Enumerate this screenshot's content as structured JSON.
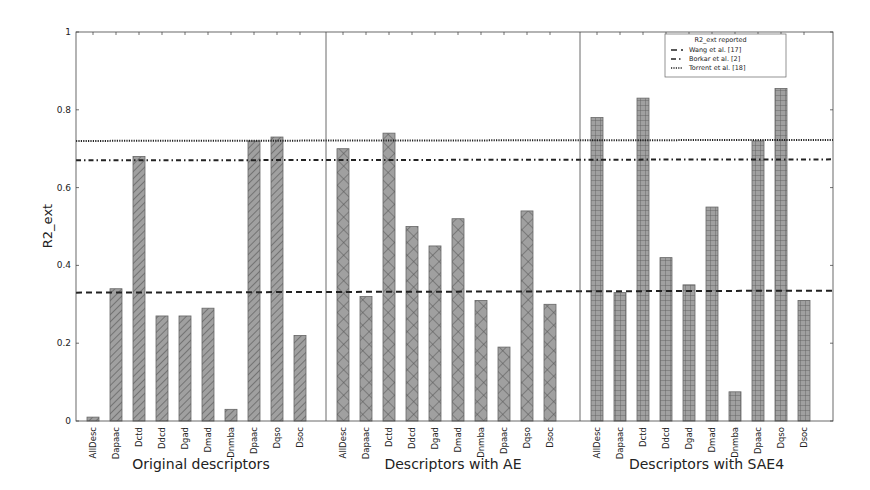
{
  "chart_data": {
    "type": "bar",
    "title": "",
    "ylabel": "R2_ext",
    "xlabel": "",
    "ylim": [
      0,
      1
    ],
    "yticks": [
      0,
      0.2,
      0.4,
      0.6,
      0.8,
      1
    ],
    "ytick_labels": [
      "0",
      "0.2",
      "0.4",
      "0.6",
      "0.8",
      "1"
    ],
    "grid": false,
    "categories": [
      "AllDesc",
      "Dapaac",
      "Dctd",
      "Ddcd",
      "Dgad",
      "Dmad",
      "Dnmba",
      "Dpaac",
      "Dqso",
      "Dsoc"
    ],
    "groups": [
      {
        "name": "Original descriptors",
        "hatch": "diagonal",
        "values": [
          0.01,
          0.34,
          0.68,
          0.27,
          0.27,
          0.29,
          0.03,
          0.72,
          0.73,
          0.22
        ]
      },
      {
        "name": "Descriptors with AE",
        "hatch": "cross",
        "values": [
          0.7,
          0.32,
          0.74,
          0.5,
          0.45,
          0.52,
          0.31,
          0.19,
          0.54,
          0.3
        ]
      },
      {
        "name": "Descriptors with SAE4",
        "hatch": "grid",
        "values": [
          0.78,
          0.33,
          0.83,
          0.42,
          0.35,
          0.55,
          0.075,
          0.72,
          0.855,
          0.31
        ]
      }
    ],
    "reference_lines": [
      {
        "name": "Wang et al. [17]",
        "value": 0.33,
        "style": "dashed"
      },
      {
        "name": "Borkar et al. [2]",
        "value": 0.67,
        "style": "dashdot"
      },
      {
        "name": "Torrent et al. [18]",
        "value": 0.72,
        "style": "dotted"
      }
    ],
    "legend": {
      "title": "R2_ext reported",
      "position": "upper right",
      "entries": [
        "Wang et al. [17]",
        "Borkar et al. [2]",
        "Torrent et al. [18]"
      ]
    },
    "colors": {
      "bar_fill": "#a0a0a0",
      "bar_edge": "#555555",
      "hatch": "#4a4a4a",
      "lines": "#222222"
    }
  }
}
